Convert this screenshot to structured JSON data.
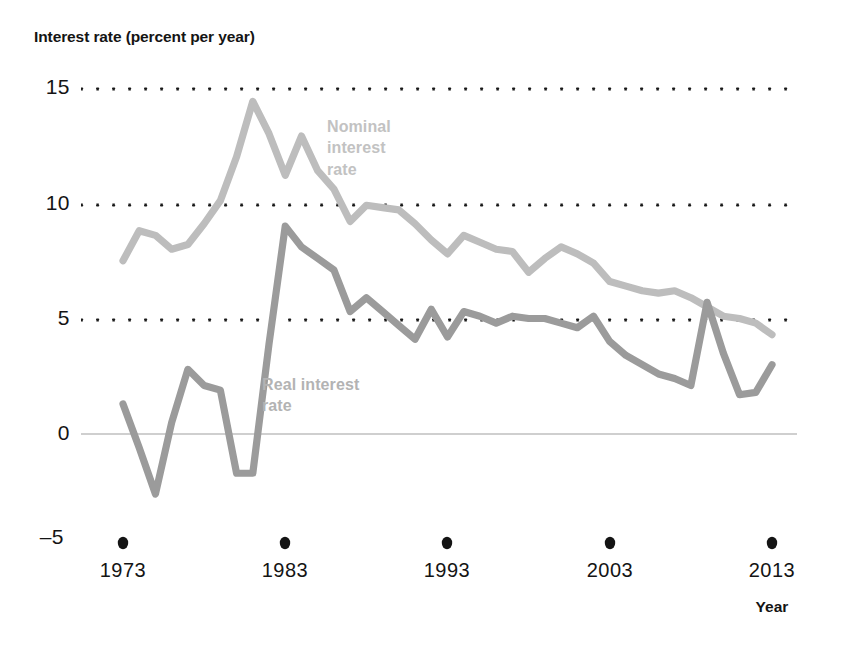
{
  "chart": {
    "title": "Interest rate (percent per year)",
    "x_axis_title": "Year"
  },
  "annotations": {
    "nominal": "Nominal\ninterest\nrate",
    "real": "Real interest\nrate"
  },
  "colors": {
    "nominal_line": "#bdbdbd",
    "real_line": "#9b9b9b",
    "gridline_dots": "#1a1a1a",
    "zero_line": "#cfcfcf",
    "text": "#141414"
  },
  "chart_data": {
    "type": "line",
    "title": "Interest rate (percent per year)",
    "xlabel": "Year",
    "ylabel": "Interest rate (percent per year)",
    "xlim": [
      1973,
      2013
    ],
    "ylim": [
      -5,
      15
    ],
    "xticks": [
      1973,
      1983,
      1993,
      2003,
      2013
    ],
    "yticks": [
      -5,
      0,
      5,
      10,
      15
    ],
    "ytick_labels": [
      "–5",
      "0",
      "5",
      "10",
      "15"
    ],
    "grid": "dotted-horizontal",
    "legend": "inline-annotations",
    "x": [
      1973,
      1974,
      1975,
      1976,
      1977,
      1978,
      1979,
      1980,
      1981,
      1982,
      1983,
      1984,
      1985,
      1986,
      1987,
      1988,
      1989,
      1990,
      1991,
      1992,
      1993,
      1994,
      1995,
      1996,
      1997,
      1998,
      1999,
      2000,
      2001,
      2002,
      2003,
      2004,
      2005,
      2006,
      2007,
      2008,
      2009,
      2010,
      2011,
      2012,
      2013
    ],
    "series": [
      {
        "name": "Nominal interest rate",
        "color": "#bdbdbd",
        "values": [
          7.5,
          8.8,
          8.6,
          8.0,
          8.2,
          9.1,
          10.1,
          12.0,
          14.4,
          13.0,
          11.2,
          12.9,
          11.4,
          10.6,
          9.2,
          9.9,
          9.8,
          9.7,
          9.1,
          8.4,
          7.8,
          8.6,
          8.3,
          8.0,
          7.9,
          7.0,
          7.6,
          8.1,
          7.8,
          7.4,
          6.6,
          6.4,
          6.2,
          6.1,
          6.2,
          5.9,
          5.5,
          5.1,
          5.0,
          4.8,
          4.3
        ]
      },
      {
        "name": "Real interest rate",
        "color": "#9b9b9b",
        "values": [
          1.3,
          -0.6,
          -2.6,
          0.5,
          2.8,
          2.1,
          1.9,
          -1.7,
          -1.7,
          3.9,
          9.0,
          8.1,
          7.6,
          7.1,
          5.3,
          5.9,
          5.3,
          4.7,
          4.1,
          5.4,
          4.2,
          5.3,
          5.1,
          4.8,
          5.1,
          5.0,
          5.0,
          4.8,
          4.6,
          5.1,
          4.0,
          3.4,
          3.0,
          2.6,
          2.4,
          2.1,
          5.7,
          3.5,
          1.7,
          1.8,
          3.0
        ]
      }
    ]
  }
}
